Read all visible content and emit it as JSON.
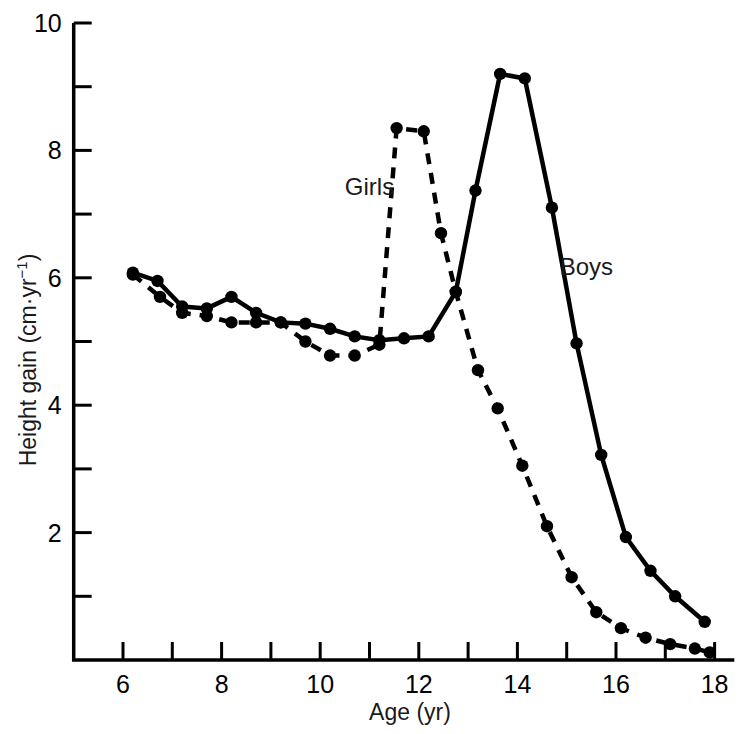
{
  "chart_data": {
    "type": "line",
    "title": "",
    "xlabel": "Age (yr)",
    "ylabel_main": "Height gain (cm",
    "ylabel_mid": "·yr",
    "ylabel_sup": "−1",
    "ylabel_close": ")",
    "ylabel_full": "Height gain (cm·yr⁻¹)",
    "xlim": [
      5.0,
      18.4
    ],
    "ylim": [
      0,
      10
    ],
    "xticks_major": [
      6,
      8,
      10,
      12,
      14,
      16,
      18
    ],
    "xticks_minor": [
      7,
      9,
      11,
      13,
      15,
      17
    ],
    "xtick_labels": [
      "6",
      "8",
      "10",
      "12",
      "14",
      "16",
      "18"
    ],
    "yticks_major": [
      2,
      4,
      6,
      8,
      10
    ],
    "yticks_minor": [
      1,
      3,
      5,
      7,
      9
    ],
    "ytick_labels": [
      "2",
      "4",
      "6",
      "8",
      "10"
    ],
    "grid": false,
    "legend_position": "inline-annotation",
    "tick_direction": "in",
    "marker": "filled-circle",
    "series": [
      {
        "name": "Girls",
        "linestyle": "dashed",
        "color": "#000000",
        "label_x": 11.0,
        "label_y": 7.3,
        "x": [
          6.2,
          6.75,
          7.2,
          7.7,
          8.2,
          8.7,
          9.2,
          9.7,
          10.2,
          10.7,
          11.2,
          11.55,
          12.1,
          12.45,
          12.75,
          13.2,
          13.6,
          14.1,
          14.6,
          15.1,
          15.6,
          16.1,
          16.6,
          17.1,
          17.6,
          17.9
        ],
        "y": [
          6.05,
          5.7,
          5.45,
          5.4,
          5.3,
          5.3,
          5.3,
          5.0,
          4.78,
          4.78,
          4.95,
          8.35,
          8.3,
          6.7,
          5.78,
          4.55,
          3.95,
          3.05,
          2.1,
          1.3,
          0.75,
          0.5,
          0.35,
          0.25,
          0.18,
          0.12
        ]
      },
      {
        "name": "Boys",
        "linestyle": "solid",
        "color": "#000000",
        "label_x": 15.4,
        "label_y": 6.05,
        "x": [
          6.2,
          6.7,
          7.2,
          7.7,
          8.2,
          8.7,
          9.2,
          9.7,
          10.2,
          10.7,
          11.2,
          11.7,
          12.2,
          12.75,
          13.15,
          13.65,
          14.15,
          14.7,
          15.2,
          15.7,
          16.2,
          16.7,
          17.2,
          17.8
        ],
        "y": [
          6.08,
          5.95,
          5.55,
          5.52,
          5.7,
          5.45,
          5.3,
          5.28,
          5.2,
          5.08,
          5.02,
          5.05,
          5.08,
          5.78,
          7.37,
          9.2,
          9.13,
          7.1,
          4.97,
          3.22,
          1.93,
          1.4,
          1.0,
          0.6
        ]
      }
    ]
  }
}
